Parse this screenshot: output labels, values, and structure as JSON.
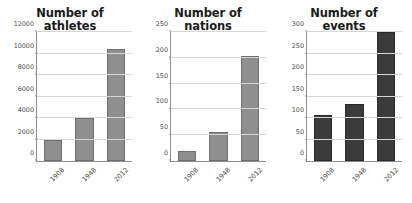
{
  "figure": {
    "background": "#ffffff",
    "bar_color_light": "#8f8f8f",
    "bar_color_dark": "#3b3b3b",
    "grid_color": "#d6d6d6",
    "axis_color": "#8c8c8c",
    "title_color": "#1a1a1a"
  },
  "chart_data": [
    {
      "type": "bar",
      "title": "Number of athletes",
      "title_line1": "Number of",
      "title_line2": "athletes",
      "categories": [
        "1908",
        "1948",
        "2012"
      ],
      "values": [
        2000,
        4030,
        10450
      ],
      "xlabel": "",
      "ylabel": "",
      "ylim": [
        0,
        12000
      ],
      "yticks": [
        0,
        2000,
        4000,
        6000,
        8000,
        10000,
        12000
      ],
      "ytick_labels": [
        "0",
        "2000",
        "4000",
        "6000",
        "8000",
        "10000",
        "12000"
      ],
      "grid": true,
      "legend": null,
      "bar_style": "light"
    },
    {
      "type": "bar",
      "title": "Number of nations",
      "title_line1": "Number of",
      "title_line2": "nations",
      "categories": [
        "1908",
        "1948",
        "2012"
      ],
      "values": [
        20,
        57,
        204
      ],
      "xlabel": "",
      "ylabel": "",
      "ylim": [
        0,
        250
      ],
      "yticks": [
        0,
        50,
        100,
        150,
        200,
        250
      ],
      "ytick_labels": [
        "0",
        "50",
        "100",
        "150",
        "200",
        "250"
      ],
      "grid": true,
      "legend": null,
      "bar_style": "light"
    },
    {
      "type": "bar",
      "title": "Number of events",
      "title_line1": "Number of",
      "title_line2": "events",
      "categories": [
        "1908",
        "1948",
        "2012"
      ],
      "values": [
        108,
        133,
        300
      ],
      "xlabel": "",
      "ylabel": "",
      "ylim": [
        0,
        300
      ],
      "yticks": [
        0,
        50,
        100,
        150,
        200,
        250,
        300
      ],
      "ytick_labels": [
        "0",
        "50",
        "100",
        "150",
        "200",
        "250",
        "300"
      ],
      "grid": true,
      "legend": null,
      "bar_style": "dark"
    }
  ]
}
